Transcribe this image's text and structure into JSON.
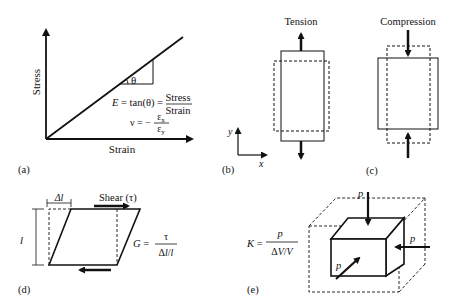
{
  "panels": {
    "a": {
      "label": "(a)",
      "ylabel": "Stress",
      "xlabel": "Strain",
      "angle": "θ",
      "eq1_lhs": "E = tan(θ) =",
      "eq1_num": "Stress",
      "eq1_den": "Strain",
      "eq2_lhs": "ν = −",
      "eq2_num": "εx",
      "eq2_den": "εy"
    },
    "b": {
      "label": "(b)",
      "title": "Tension",
      "axis_x": "x",
      "axis_y": "y"
    },
    "c": {
      "label": "(c)",
      "title": "Compression"
    },
    "d": {
      "label": "(d)",
      "delta_l": "Δl",
      "length": "l",
      "shear": "Shear (τ)",
      "eq_lhs": "G =",
      "eq_num": "τ",
      "eq_den": "Δl/l"
    },
    "e": {
      "label": "(e)",
      "eq_lhs": "K =",
      "eq_num": "p",
      "eq_den": "ΔV/V",
      "p_top": "p",
      "p_right": "p",
      "p_front": "p"
    }
  },
  "colors": {
    "stroke": "#111111",
    "background": "#ffffff"
  }
}
